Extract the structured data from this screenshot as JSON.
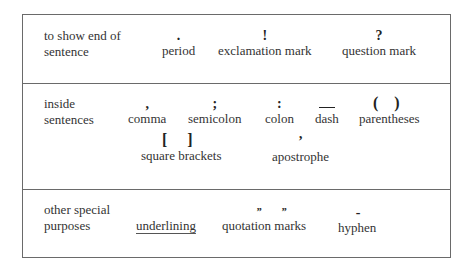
{
  "rows": [
    {
      "category": "to show end of sentence",
      "category_lines": [
        "to show end of",
        "sentence"
      ],
      "items": [
        {
          "mark": ".",
          "label": "period"
        },
        {
          "mark": "!",
          "label": "exclamation mark"
        },
        {
          "mark": "?",
          "label": "question mark"
        }
      ]
    },
    {
      "category": "inside sentences",
      "category_lines": [
        "inside",
        "sentences"
      ],
      "items": [
        {
          "mark": ",",
          "label": "comma"
        },
        {
          "mark": ";",
          "label": "semicolon"
        },
        {
          "mark": ":",
          "label": "colon"
        },
        {
          "mark": "—",
          "label": "dash"
        },
        {
          "mark": "( )",
          "label": "parentheses"
        },
        {
          "mark": "[ ]",
          "label": "square brackets"
        },
        {
          "mark": "’",
          "label": "apostrophe"
        }
      ]
    },
    {
      "category": "other special purposes",
      "category_lines": [
        "other special",
        "purposes"
      ],
      "items": [
        {
          "mark": "",
          "label": "underlining"
        },
        {
          "mark": "” ”",
          "open_mark": "”",
          "close_mark": "”",
          "label": "quotation marks"
        },
        {
          "mark": "-",
          "label": "hyphen"
        }
      ]
    }
  ]
}
